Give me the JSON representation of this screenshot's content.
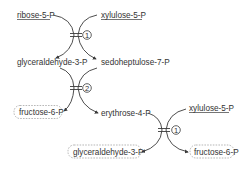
{
  "diagram": {
    "type": "pentose phosphate pathway (non-oxidative) reaction scheme",
    "colors": {
      "ink": "#333333",
      "dashed_box": "#9a9a9a",
      "background": "#ffffff"
    },
    "reactions": [
      {
        "id": "r1_top",
        "enzyme_number": "1",
        "substrates": [
          "ribose-5-P",
          "xylulose-5-P"
        ],
        "products": [
          "glyceraldehyde-3-P",
          "sedoheptulose-7-P"
        ]
      },
      {
        "id": "r2",
        "enzyme_number": "2",
        "substrates": [
          "glyceraldehyde-3-P",
          "sedoheptulose-7-P"
        ],
        "products": [
          "fructose-6-P",
          "erythrose-4-P"
        ]
      },
      {
        "id": "r1_bottom",
        "enzyme_number": "1",
        "substrates": [
          "erythrose-4-P",
          "xylulose-5-P"
        ],
        "products": [
          "glyceraldehyde-3-P",
          "fructose-6-P"
        ]
      }
    ],
    "labels": {
      "ribose5p": "ribose-5-P",
      "xylulose5p_top": "xylulose-5-P",
      "gap_mid": "glyceraldehyde-3-P",
      "sedo7p": "sedoheptulose-7-P",
      "fructose6p_left": "fructose-6-P",
      "erythrose4p": "erythrose-4-P",
      "xylulose5p_bottom": "xylulose-5-P",
      "gap_bottom": "glyceraldehyde-3-P",
      "fructose6p_right": "fructose-6-P"
    },
    "enzyme_markers": {
      "r1_top": "1",
      "r2": "2",
      "r1_bottom": "1"
    },
    "legend_styles": {
      "underlined": "input substrates",
      "dashed_box": "final products"
    }
  }
}
